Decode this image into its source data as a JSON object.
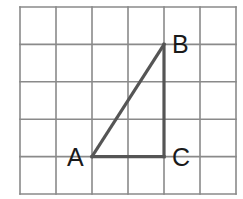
{
  "diagram": {
    "type": "grid-triangle",
    "grid": {
      "columns": 6,
      "rows": 5,
      "origin_px": [
        20,
        7
      ],
      "cell_w": 36,
      "cell_h": 37.4,
      "line_color": "#8a8a8a"
    },
    "triangle": {
      "stroke_color": "#555555",
      "vertices": {
        "A": {
          "label": "A",
          "grid": [
            2,
            4
          ]
        },
        "B": {
          "label": "B",
          "grid": [
            4,
            1
          ]
        },
        "C": {
          "label": "C",
          "grid": [
            4,
            4
          ]
        }
      },
      "edges": [
        [
          "A",
          "B"
        ],
        [
          "B",
          "C"
        ],
        [
          "C",
          "A"
        ]
      ],
      "right_angle_at": "C"
    }
  }
}
